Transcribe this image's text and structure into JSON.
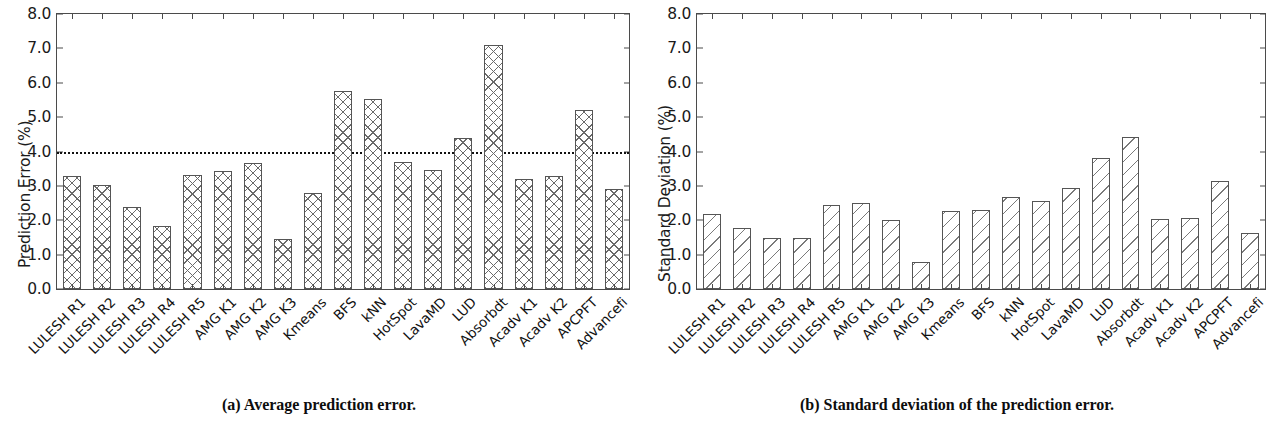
{
  "figure": {
    "panels": [
      {
        "id": "a",
        "caption": "(a) Average prediction error.",
        "hatch": "cross"
      },
      {
        "id": "b",
        "caption": "(b) Standard deviation of the prediction error.",
        "hatch": "diag"
      }
    ]
  },
  "chart_data": [
    {
      "type": "bar",
      "title": "(a) Average prediction error.",
      "xlabel": "",
      "ylabel": "Prediction Error (%)",
      "ylim": [
        0.0,
        8.0
      ],
      "yticks": [
        "0.0",
        "1.0",
        "2.0",
        "3.0",
        "4.0",
        "5.0",
        "6.0",
        "7.0",
        "8.0"
      ],
      "ytick_values": [
        0.0,
        1.0,
        2.0,
        3.0,
        4.0,
        5.0,
        6.0,
        7.0,
        8.0
      ],
      "grid": false,
      "legend": "none",
      "hatch": "crosshatch",
      "annotations": [
        {
          "type": "hline",
          "value": 4.0,
          "style": "dotted",
          "color": "#111111"
        }
      ],
      "categories": [
        "LULESH R1",
        "LULESH R2",
        "LULESH R3",
        "LULESH R4",
        "LULESH R5",
        "AMG K1",
        "AMG K2",
        "AMG K3",
        "Kmeans",
        "BFS",
        "kNN",
        "HotSpot",
        "LavaMD",
        "LUD",
        "Absorbdt",
        "Acadv K1",
        "Acadv K2",
        "APCPFT",
        "Advancefi"
      ],
      "values": [
        3.3,
        3.02,
        2.4,
        1.82,
        3.32,
        3.42,
        3.68,
        1.46,
        2.8,
        5.76,
        5.54,
        3.7,
        3.45,
        4.4,
        7.1,
        3.2,
        3.3,
        5.2,
        2.9
      ]
    },
    {
      "type": "bar",
      "title": "(b) Standard deviation of the prediction error.",
      "xlabel": "",
      "ylabel": "Standard Deviation (%)",
      "ylim": [
        0.0,
        8.0
      ],
      "yticks": [
        "0.0",
        "1.0",
        "2.0",
        "3.0",
        "4.0",
        "5.0",
        "6.0",
        "7.0",
        "8.0"
      ],
      "ytick_values": [
        0.0,
        1.0,
        2.0,
        3.0,
        4.0,
        5.0,
        6.0,
        7.0,
        8.0
      ],
      "grid": false,
      "legend": "none",
      "hatch": "diagonal",
      "annotations": [],
      "categories": [
        "LULESH R1",
        "LULESH R2",
        "LULESH R3",
        "LULESH R4",
        "LULESH R5",
        "AMG K1",
        "AMG K2",
        "AMG K3",
        "Kmeans",
        "BFS",
        "kNN",
        "HotSpot",
        "LavaMD",
        "LUD",
        "Absorbdt",
        "Acadv K1",
        "Acadv K2",
        "APCPFT",
        "Advancefi"
      ],
      "values": [
        2.18,
        1.78,
        1.48,
        1.48,
        2.44,
        2.5,
        2.0,
        0.8,
        2.26,
        2.3,
        2.68,
        2.56,
        2.94,
        3.8,
        4.42,
        2.04,
        2.08,
        3.14,
        1.62
      ]
    }
  ]
}
